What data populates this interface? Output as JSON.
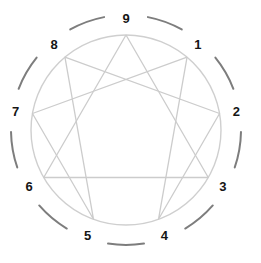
{
  "diagram": {
    "type": "enneagram",
    "canvas": {
      "width": 261,
      "height": 263
    },
    "geometry": {
      "center_x": 126,
      "center_y": 130,
      "inner_circle_radius": 95,
      "outer_arc_radius": 115,
      "label_radius": 112,
      "arc_gap_degrees": 22
    },
    "colors": {
      "background": "#ffffff",
      "outer_arc": "#7d7d7d",
      "inner_circle": "#cfcfcf",
      "figure_lines": "#cccccc",
      "label_text": "#151515"
    },
    "stroke_widths": {
      "outer_arc": 2.0,
      "inner_circle": 1.4,
      "figure_lines": 1.3
    },
    "nodes": [
      {
        "id": "node-9",
        "label": "9",
        "angle_deg": -90,
        "label_dx": 0,
        "label_dy": 0
      },
      {
        "id": "node-1",
        "label": "1",
        "angle_deg": -50,
        "label_dx": 0,
        "label_dy": 0
      },
      {
        "id": "node-2",
        "label": "2",
        "angle_deg": -10,
        "label_dx": 0,
        "label_dy": 0
      },
      {
        "id": "node-3",
        "label": "3",
        "angle_deg": 30,
        "label_dx": 0,
        "label_dy": 0
      },
      {
        "id": "node-4",
        "label": "4",
        "angle_deg": 70,
        "label_dx": 0,
        "label_dy": 0
      },
      {
        "id": "node-5",
        "label": "5",
        "angle_deg": 110,
        "label_dx": 0,
        "label_dy": 0
      },
      {
        "id": "node-6",
        "label": "6",
        "angle_deg": 150,
        "label_dx": 0,
        "label_dy": 0
      },
      {
        "id": "node-7",
        "label": "7",
        "angle_deg": 190,
        "label_dx": 0,
        "label_dy": 0
      },
      {
        "id": "node-8",
        "label": "8",
        "angle_deg": 230,
        "label_dx": 0,
        "label_dy": 0
      }
    ],
    "triangle_path": [
      "9",
      "3",
      "6",
      "9"
    ],
    "hexad_path": [
      "1",
      "4",
      "2",
      "8",
      "5",
      "7",
      "1"
    ],
    "outer_arc_segments": [
      {
        "id": "arc-9-1",
        "between": [
          "9",
          "1"
        ]
      },
      {
        "id": "arc-1-2",
        "between": [
          "1",
          "2"
        ]
      },
      {
        "id": "arc-2-3",
        "between": [
          "2",
          "3"
        ]
      },
      {
        "id": "arc-3-4",
        "between": [
          "3",
          "4"
        ]
      },
      {
        "id": "arc-4-5",
        "between": [
          "4",
          "5"
        ]
      },
      {
        "id": "arc-5-6",
        "between": [
          "5",
          "6"
        ]
      },
      {
        "id": "arc-6-7",
        "between": [
          "6",
          "7"
        ]
      },
      {
        "id": "arc-7-8",
        "between": [
          "7",
          "8"
        ]
      },
      {
        "id": "arc-8-9",
        "between": [
          "8",
          "9"
        ]
      }
    ]
  }
}
